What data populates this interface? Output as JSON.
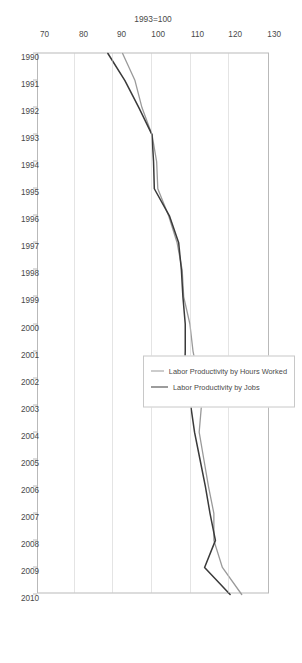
{
  "chart_data": {
    "type": "line",
    "title": "",
    "ylabel": "1993=100",
    "xlabel": "",
    "ylim": [
      70,
      130
    ],
    "yticks": [
      70,
      80,
      90,
      100,
      110,
      120,
      130
    ],
    "grid": true,
    "legend_position": "inside-right",
    "orientation": "rotated-90-clockwise",
    "categories": [
      "1990",
      "1991",
      "1992",
      "1993",
      "1994",
      "1995",
      "1996",
      "1997",
      "1998",
      "1999",
      "2000",
      "2001",
      "2002",
      "2003",
      "2004",
      "2005",
      "2006",
      "2007",
      "2008",
      "2009",
      "2010"
    ],
    "series": [
      {
        "name": "Labor Productivity by Hours Worked",
        "color": "#9a9a9a",
        "values": [
          92.4,
          95.6,
          97.4,
          100.0,
          101.2,
          101.5,
          104.3,
          106.5,
          107.8,
          108.2,
          109.8,
          110.6,
          112.0,
          112.8,
          112.2,
          113.4,
          114.6,
          116.0,
          116.0,
          118.2,
          123.2
        ]
      },
      {
        "name": "Labor Productivity by Jobs",
        "color": "#3a3a3a",
        "values": [
          88.6,
          93.0,
          96.6,
          100.0,
          100.4,
          100.6,
          104.5,
          106.9,
          107.6,
          108.0,
          108.6,
          108.6,
          108.4,
          110.0,
          111.0,
          112.4,
          113.8,
          115.0,
          116.4,
          113.6,
          120.2
        ]
      }
    ]
  },
  "axis": {
    "value_axis_title": "1993=100"
  }
}
